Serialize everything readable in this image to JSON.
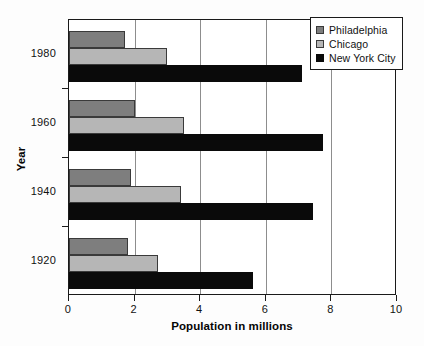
{
  "chart_data": {
    "type": "bar",
    "orientation": "horizontal",
    "title": "",
    "xlabel": "Population in millions",
    "ylabel": "Year",
    "categories": [
      "1920",
      "1940",
      "1960",
      "1980"
    ],
    "series": [
      {
        "name": "Philadelphia",
        "color": "#7e7e7e",
        "values": [
          1.8,
          1.9,
          2.0,
          1.7
        ]
      },
      {
        "name": "Chicago",
        "color": "#b6b6b6",
        "values": [
          2.7,
          3.4,
          3.5,
          3.0
        ]
      },
      {
        "name": "New York City",
        "color": "#0a0a0a",
        "values": [
          5.6,
          7.45,
          7.75,
          7.1
        ]
      }
    ],
    "xlim": [
      0,
      10
    ],
    "xticks": [
      "0",
      "2",
      "4",
      "6",
      "8",
      "10"
    ],
    "yticks": [
      "1980",
      "1960",
      "1940",
      "1920"
    ],
    "grid": "vertical",
    "legend_position": "top-right"
  },
  "legend": {
    "entries": [
      {
        "label": "Philadelphia"
      },
      {
        "label": "Chicago"
      },
      {
        "label": "New York City"
      }
    ]
  },
  "axes": {
    "x_title": "Population in millions",
    "y_title": "Year",
    "x_tick_labels": [
      "0",
      "2",
      "4",
      "6",
      "8",
      "10"
    ],
    "y_tick_labels": [
      "1980",
      "1960",
      "1940",
      "1920"
    ]
  }
}
